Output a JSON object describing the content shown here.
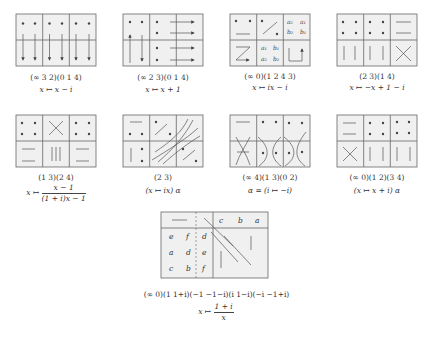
{
  "figure": {
    "colors": {
      "cell_fill": "#f0f0f0",
      "grid_line": "#666666",
      "stroke": "#555555",
      "dot": "#444444"
    },
    "panels": [
      {
        "id": "p1",
        "cycle": "(∞ 3 2)(0 1 4)",
        "map": "x ↦ x − i"
      },
      {
        "id": "p2",
        "cycle": "(∞ 2 3)(0 1 4)",
        "map": "x ↦ x + 1"
      },
      {
        "id": "p3",
        "cycle": "(∞ 0)(1 2 4 3)",
        "map": "x ↦ ix − i",
        "labels": {
          "a2": "a₂",
          "a1": "a₁",
          "b2": "b₂",
          "b1": "b₁"
        }
      },
      {
        "id": "p4",
        "cycle": "(2 3)(1 4)",
        "map": "x ↦ −x + 1 − i"
      },
      {
        "id": "p5",
        "cycle": "(1 3)(2 4)",
        "map_prefix": "x ↦",
        "map_num": "x − 1",
        "map_den": "(1 + i)x − 1"
      },
      {
        "id": "p6",
        "cycle": "(2 3)",
        "map": "(x ↦ ix) α"
      },
      {
        "id": "p7",
        "cycle": "(∞ 4)(1 3)(0 2)",
        "map": "α = (i ↦ −i)"
      },
      {
        "id": "p8",
        "cycle": "(∞ 0)(1 2)(3 4)",
        "map": "(x ↦ x + i) α"
      }
    ],
    "bottom": {
      "header_letters": [
        "c",
        "b",
        "a"
      ],
      "rows": [
        [
          "e",
          "f",
          "d"
        ],
        [
          "a",
          "d",
          "e"
        ],
        [
          "c",
          "b",
          "f"
        ]
      ],
      "cycle": "(∞ 0)(1  1+i)(−1  −1−i)(i  1−i)(−i  −1+i)",
      "map_prefix": "x ↦",
      "map_num": "1 + i",
      "map_den": "x"
    }
  }
}
